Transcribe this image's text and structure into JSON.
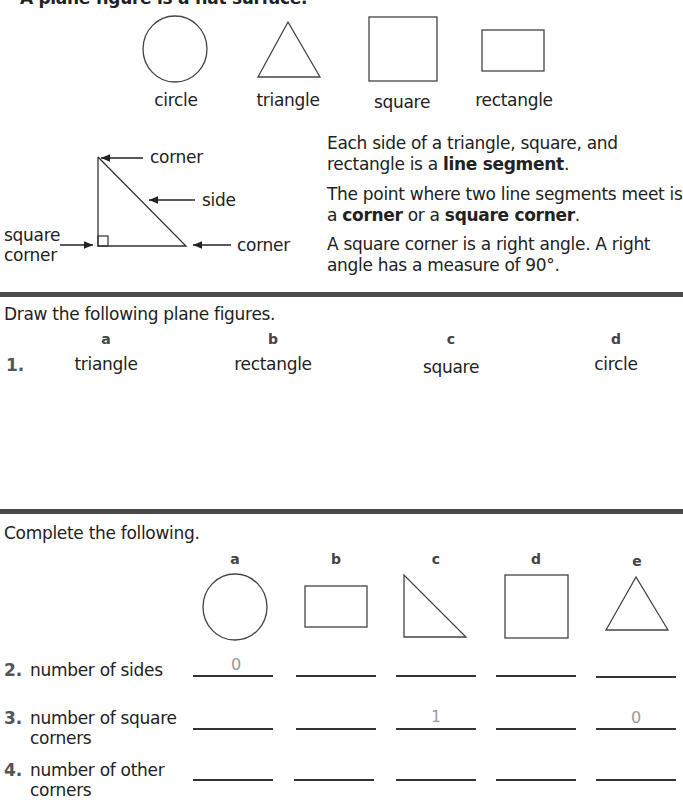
{
  "header": {
    "intro_text_partial": "A plane figure is a flat surface."
  },
  "intro_figures": [
    {
      "label": "circle",
      "shape": "circle"
    },
    {
      "label": "triangle",
      "shape": "triangle"
    },
    {
      "label": "square",
      "shape": "square"
    },
    {
      "label": "rectangle",
      "shape": "rectangle"
    }
  ],
  "diagram": {
    "labels": {
      "top_corner": "corner",
      "side": "side",
      "bottom_corner": "corner",
      "square_corner_line1": "square",
      "square_corner_line2": "corner"
    }
  },
  "definitions": {
    "p1_pre": "Each side of a triangle, square, and rectangle is a ",
    "p1_bold": "line segment",
    "p1_post": ".",
    "p2_pre": "The point where two line segments meet is a ",
    "p2_bold1": "corner",
    "p2_mid": " or a ",
    "p2_bold2": "square corner",
    "p2_post": ".",
    "p3": "A square corner is a right angle. A right angle has a measure of 90°."
  },
  "draw_section": {
    "instruction": "Draw the following plane figures.",
    "item_number": "1.",
    "columns": [
      {
        "letter": "a",
        "figure": "triangle"
      },
      {
        "letter": "b",
        "figure": "rectangle"
      },
      {
        "letter": "c",
        "figure": "square"
      },
      {
        "letter": "d",
        "figure": "circle"
      }
    ]
  },
  "complete_section": {
    "instruction": "Complete the following.",
    "columns": [
      {
        "letter": "a",
        "shape": "circle"
      },
      {
        "letter": "b",
        "shape": "rectangle"
      },
      {
        "letter": "c",
        "shape": "right-triangle"
      },
      {
        "letter": "d",
        "shape": "square"
      },
      {
        "letter": "e",
        "shape": "triangle"
      }
    ],
    "rows": [
      {
        "number": "2.",
        "label_line1": "number of sides",
        "label_line2": "",
        "answers": [
          "0",
          "",
          "",
          "",
          ""
        ]
      },
      {
        "number": "3.",
        "label_line1": "number of square",
        "label_line2": "corners",
        "answers": [
          "",
          "",
          "1",
          "",
          "0"
        ]
      },
      {
        "number": "4.",
        "label_line1": "number of other",
        "label_line2": "corners",
        "answers": [
          "",
          "",
          "",
          "",
          ""
        ]
      }
    ]
  },
  "colors": {
    "text": "#222222",
    "divider": "#4a4a4a",
    "answer_ink": "#999999",
    "item_number": "#555555"
  }
}
